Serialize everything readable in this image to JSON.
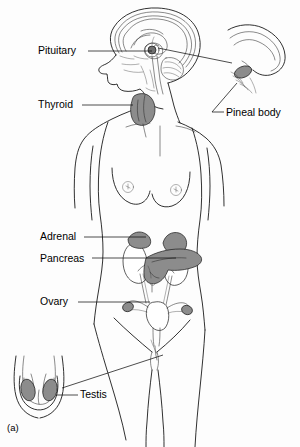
{
  "figure": {
    "panel_label": "(a)",
    "title_visible": false,
    "background_color": "#fdfdfd",
    "ink_color": "#1a1a1a",
    "organ_fill_color": "#8c8c8c",
    "organ_fill_dark": "#6f6f6f"
  },
  "labels": [
    {
      "id": "pituitary",
      "text": "Pituitary",
      "text_x": 38,
      "text_y": 54,
      "anchor": "start",
      "leader": "M 88 51 L 105 51 L 152 51"
    },
    {
      "id": "thyroid",
      "text": "Thyroid",
      "text_x": 38,
      "text_y": 108,
      "anchor": "start",
      "leader": "M 82 105 L 132 105"
    },
    {
      "id": "pineal-body",
      "text": "Pineal body",
      "text_x": 226,
      "text_y": 116,
      "anchor": "start",
      "leader": "M 224 112 L 210 112 L 238 82"
    },
    {
      "id": "adrenal",
      "text": "Adrenal",
      "text_x": 40,
      "text_y": 240,
      "anchor": "start",
      "leader": "M 84 237 L 146 237"
    },
    {
      "id": "pancreas",
      "text": "Pancreas",
      "text_x": 40,
      "text_y": 262,
      "anchor": "start",
      "leader": "M 92 258 L 174 258"
    },
    {
      "id": "ovary",
      "text": "Ovary",
      "text_x": 40,
      "text_y": 305,
      "anchor": "start",
      "leader": "M 78 302 L 148 302"
    },
    {
      "id": "testis",
      "text": "Testis",
      "text_x": 80,
      "text_y": 398,
      "anchor": "start",
      "leader": "M 78 395 L 58 395"
    }
  ],
  "inset_connectors": [
    {
      "id": "brain-to-pineal-inset",
      "from": "brain-pineal-region",
      "to": "pineal-inset",
      "path": "M 158 48 L 232 63"
    },
    {
      "id": "groin-to-testis-inset",
      "from": "pelvis-groin",
      "to": "testis-inset",
      "path": "M 163 355 L 62 388"
    }
  ],
  "organs": [
    {
      "id": "pituitary-gland",
      "name": "pituitary",
      "region": "head"
    },
    {
      "id": "pineal-gland",
      "name": "pineal body",
      "region": "head-inset"
    },
    {
      "id": "thyroid-gland",
      "name": "thyroid",
      "region": "neck"
    },
    {
      "id": "adrenal-gland-left",
      "name": "adrenal",
      "region": "abdomen"
    },
    {
      "id": "adrenal-gland-right",
      "name": "adrenal",
      "region": "abdomen"
    },
    {
      "id": "pancreas-organ",
      "name": "pancreas",
      "region": "abdomen"
    },
    {
      "id": "ovary-left",
      "name": "ovary",
      "region": "pelvis"
    },
    {
      "id": "ovary-right",
      "name": "ovary",
      "region": "pelvis"
    },
    {
      "id": "testis-left",
      "name": "testis",
      "region": "scrotum-inset"
    },
    {
      "id": "testis-right",
      "name": "testis",
      "region": "scrotum-inset"
    }
  ]
}
